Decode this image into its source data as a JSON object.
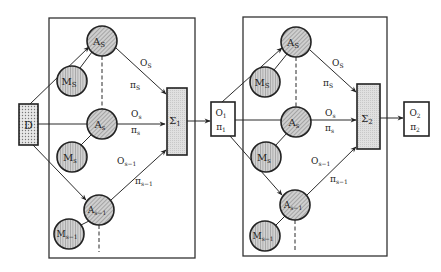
{
  "colors": {
    "stroke": "#2a2a2a",
    "node_fill": "#bdbdbd",
    "box_fill": "#dcdcdc",
    "background": "#ffffff"
  },
  "input_node": {
    "label": "D"
  },
  "stages": [
    {
      "agents": [
        {
          "label": "A",
          "sub": "S"
        },
        {
          "label": "A",
          "sub": "s"
        },
        {
          "label": "A",
          "sub": "s−1"
        }
      ],
      "models": [
        {
          "label": "M",
          "sub": "S"
        },
        {
          "label": "M",
          "sub": "s"
        },
        {
          "label": "M",
          "sub": "s−1"
        }
      ],
      "edge_labels": [
        {
          "o": "O",
          "o_sub": "S",
          "p": "π",
          "p_sub": "S"
        },
        {
          "o": "O",
          "o_sub": "s",
          "p": "π",
          "p_sub": "s"
        },
        {
          "o": "O",
          "o_sub": "s−1",
          "p": "π",
          "p_sub": "s−1"
        }
      ],
      "aggregator": {
        "label": "Σ",
        "sub": "1"
      },
      "output": {
        "o": "O",
        "o_sub": "1",
        "p": "π",
        "p_sub": "1"
      }
    },
    {
      "agents": [
        {
          "label": "A",
          "sub": "S"
        },
        {
          "label": "A",
          "sub": "s"
        },
        {
          "label": "A",
          "sub": "s−1"
        }
      ],
      "models": [
        {
          "label": "M",
          "sub": "S"
        },
        {
          "label": "M",
          "sub": "s"
        },
        {
          "label": "M",
          "sub": "s−1"
        }
      ],
      "edge_labels": [
        {
          "o": "O",
          "o_sub": "S",
          "p": "π",
          "p_sub": "S"
        },
        {
          "o": "O",
          "o_sub": "s",
          "p": "π",
          "p_sub": "s"
        },
        {
          "o": "O",
          "o_sub": "s−1",
          "p": "π",
          "p_sub": "s−1"
        }
      ],
      "aggregator": {
        "label": "Σ",
        "sub": "2"
      },
      "output": {
        "o": "O",
        "o_sub": "2",
        "p": "π",
        "p_sub": "2"
      }
    }
  ]
}
